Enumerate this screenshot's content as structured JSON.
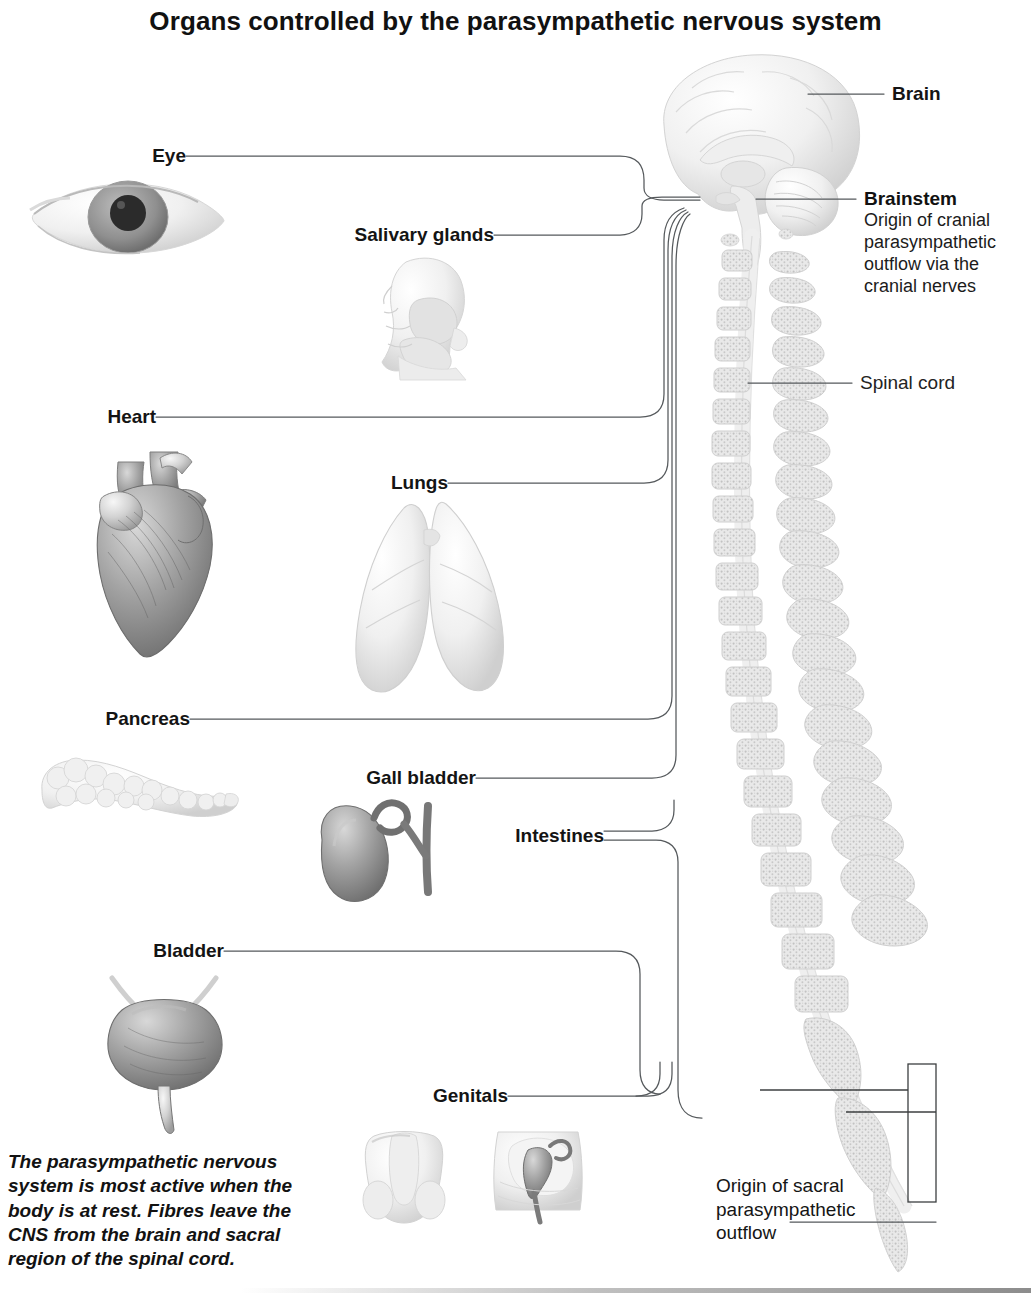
{
  "title": "Organs controlled by the parasympathetic nervous system",
  "caption": "The parasympathetic nervous system is most active when the body is at rest. Fibres leave the CNS from the brain and sacral region of the spinal cord.",
  "left_labels": [
    {
      "id": "eye",
      "text": "Eye"
    },
    {
      "id": "salivary",
      "text": "Salivary glands"
    },
    {
      "id": "heart",
      "text": "Heart"
    },
    {
      "id": "lungs",
      "text": "Lungs"
    },
    {
      "id": "pancreas",
      "text": "Pancreas"
    },
    {
      "id": "gall-bladder",
      "text": "Gall bladder"
    },
    {
      "id": "intestines",
      "text": "Intestines"
    },
    {
      "id": "bladder",
      "text": "Bladder"
    },
    {
      "id": "genitals",
      "text": "Genitals"
    }
  ],
  "right_labels": {
    "brain": "Brain",
    "brainstem_head": "Brainstem",
    "brainstem_body": "Origin of cranial parasympathetic outflow via the cranial nerves",
    "spinal_cord": "Spinal cord",
    "sacral_outflow": "Origin of sacral parasympathetic outflow"
  },
  "organs": [
    {
      "id": "eye-illustration",
      "name": "eye"
    },
    {
      "id": "salivary-illustration",
      "name": "salivary glands (head in profile)"
    },
    {
      "id": "heart-illustration",
      "name": "heart"
    },
    {
      "id": "lungs-illustration",
      "name": "lungs"
    },
    {
      "id": "pancreas-illustration",
      "name": "pancreas"
    },
    {
      "id": "gall-bladder-illustration",
      "name": "gall bladder"
    },
    {
      "id": "bladder-illustration",
      "name": "urinary bladder"
    },
    {
      "id": "genitals-illustration-male",
      "name": "male genitals"
    },
    {
      "id": "genitals-illustration-female",
      "name": "female genitals"
    },
    {
      "id": "brain-illustration",
      "name": "brain midsagittal section"
    },
    {
      "id": "spine-illustration",
      "name": "vertebral column and spinal cord"
    }
  ],
  "colors": {
    "text": "#141414",
    "muted": "#4a4a4a",
    "line": "#55595c",
    "organ_light": "#f2f2f2",
    "organ_mid": "#c9c9c9",
    "organ_dark": "#8e8e8e"
  }
}
